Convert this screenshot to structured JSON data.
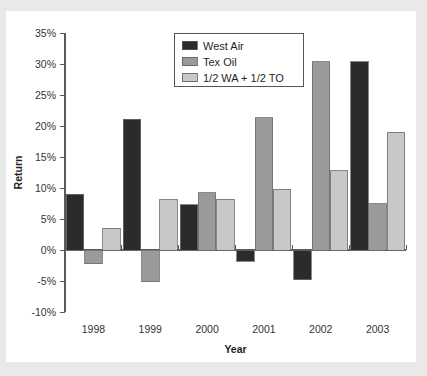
{
  "figure": {
    "background_color": "#e9e9e9",
    "panel_color": "#ffffff",
    "clipped_top_text": "",
    "y_axis_title": "Return",
    "x_axis_title": "Year"
  },
  "chart_data": {
    "type": "bar",
    "title": "",
    "xlabel": "Year",
    "ylabel": "Return",
    "categories": [
      "1998",
      "1999",
      "2000",
      "2001",
      "2002",
      "2003"
    ],
    "ylim": [
      -10,
      35
    ],
    "ytick_values": [
      35,
      30,
      25,
      20,
      15,
      10,
      5,
      0,
      -5,
      -10
    ],
    "ytick_labels": [
      "35%",
      "30%",
      "25%",
      "20%",
      "15%",
      "10%",
      "5%",
      "0%",
      "-5%",
      "-10%"
    ],
    "grid": false,
    "legend_position": "top-center",
    "units": "percent",
    "series": [
      {
        "name": "West Air",
        "color": "#2b2b2b",
        "values": [
          9.0,
          21.1,
          7.3,
          -1.8,
          -4.8,
          30.4
        ]
      },
      {
        "name": "Tex Oil",
        "color": "#9a9a9a",
        "values": [
          -2.2,
          -5.1,
          9.2,
          21.3,
          30.4,
          7.5
        ]
      },
      {
        "name": "1/2 WA + 1/2 TO",
        "color": "#c8c8c8",
        "values": [
          3.5,
          8.1,
          8.2,
          9.8,
          12.8,
          19.0
        ]
      }
    ]
  }
}
